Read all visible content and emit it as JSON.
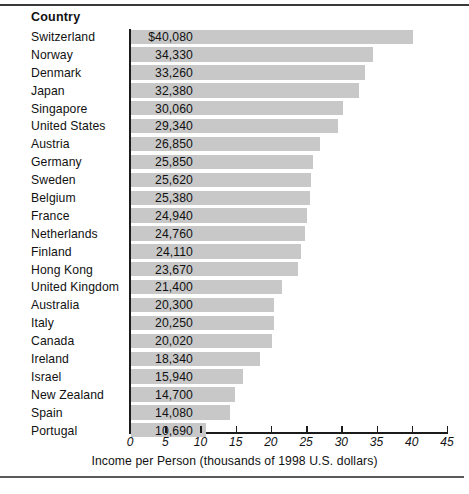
{
  "rules": {
    "top": "horizontal-rule",
    "bottom": "horizontal-rule"
  },
  "header": {
    "column_label": "Country"
  },
  "chart_data": {
    "type": "bar",
    "orientation": "horizontal",
    "title": "",
    "xlabel": "Income per Person (thousands of 1998 U.S. dollars)",
    "ylabel": "Country",
    "xlim": [
      0,
      45
    ],
    "xticks": [
      0,
      5,
      10,
      15,
      20,
      25,
      30,
      35,
      40,
      45
    ],
    "xtick_labels": [
      "0",
      "5",
      "10",
      "15",
      "20",
      "25",
      "30",
      "35",
      "40",
      "45"
    ],
    "grid": false,
    "legend": false,
    "bar_color": "#c8c8c8",
    "units": "thousands of 1998 U.S. dollars",
    "categories": [
      "Switzerland",
      "Norway",
      "Denmark",
      "Japan",
      "Singapore",
      "United States",
      "Austria",
      "Germany",
      "Sweden",
      "Belgium",
      "France",
      "Netherlands",
      "Finland",
      "Hong Kong",
      "United Kingdom",
      "Australia",
      "Italy",
      "Canada",
      "Ireland",
      "Israel",
      "New Zealand",
      "Spain",
      "Portugal"
    ],
    "values": [
      40.08,
      34.33,
      33.26,
      32.38,
      30.06,
      29.34,
      26.85,
      25.85,
      25.62,
      25.38,
      24.94,
      24.76,
      24.11,
      23.67,
      21.4,
      20.3,
      20.25,
      20.02,
      18.34,
      15.94,
      14.7,
      14.08,
      10.69
    ],
    "value_labels": [
      "$40,080",
      "34,330",
      "33,260",
      "32,380",
      "30,060",
      "29,340",
      "26,850",
      "25,850",
      "25,620",
      "25,380",
      "24,940",
      "24,760",
      "24,110",
      "23,670",
      "21,400",
      "20,300",
      "20,250",
      "20,020",
      "18,340",
      "15,940",
      "14,700",
      "14,080",
      "10,690"
    ]
  }
}
